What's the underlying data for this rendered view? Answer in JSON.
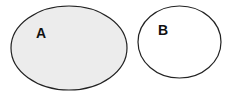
{
  "diagram": {
    "type": "venn-disjoint-sets",
    "sets": [
      {
        "label": "A",
        "fill": "#ececec",
        "stroke": "#222222",
        "cx": 69,
        "cy": 48,
        "rx": 58,
        "ry": 42,
        "label_x": 36,
        "label_y": 38
      },
      {
        "label": "B",
        "fill": "#ffffff",
        "stroke": "#222222",
        "cx": 179.5,
        "cy": 42,
        "rx": 41.5,
        "ry": 36,
        "label_x": 158,
        "label_y": 35
      }
    ]
  }
}
